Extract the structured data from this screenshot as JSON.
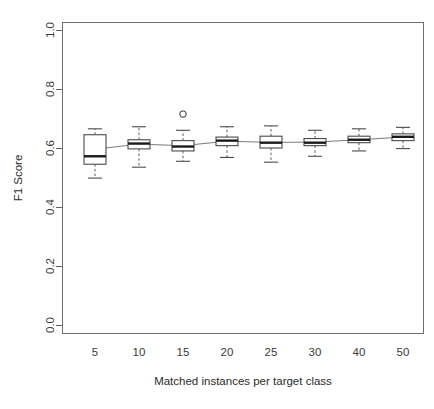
{
  "chart_data": {
    "type": "box",
    "title": "",
    "xlabel": "Matched instances per target class",
    "ylabel": "F1 Score",
    "categories": [
      "5",
      "10",
      "15",
      "20",
      "25",
      "30",
      "40",
      "50"
    ],
    "xtick_labels": [
      "5",
      "10",
      "15",
      "20",
      "25",
      "30",
      "40",
      "50"
    ],
    "ytick_labels": [
      "0.0",
      "0.2",
      "0.4",
      "0.6",
      "0.8",
      "1.0"
    ],
    "ytick_values": [
      0.0,
      0.2,
      0.4,
      0.6,
      0.8,
      1.0
    ],
    "ylim": [
      0.0,
      1.0
    ],
    "grid": false,
    "legend": null,
    "boxes": [
      {
        "category": "5",
        "whisker_low": 0.498,
        "q1": 0.545,
        "median": 0.572,
        "q3": 0.645,
        "whisker_high": 0.665,
        "outliers": []
      },
      {
        "category": "10",
        "whisker_low": 0.535,
        "q1": 0.597,
        "median": 0.615,
        "q3": 0.628,
        "whisker_high": 0.672,
        "outliers": []
      },
      {
        "category": "15",
        "whisker_low": 0.555,
        "q1": 0.59,
        "median": 0.605,
        "q3": 0.625,
        "whisker_high": 0.66,
        "outliers": [
          0.715
        ]
      },
      {
        "category": "20",
        "whisker_low": 0.568,
        "q1": 0.608,
        "median": 0.625,
        "q3": 0.637,
        "whisker_high": 0.672,
        "outliers": []
      },
      {
        "category": "25",
        "whisker_low": 0.552,
        "q1": 0.6,
        "median": 0.618,
        "q3": 0.64,
        "whisker_high": 0.675,
        "outliers": []
      },
      {
        "category": "30",
        "whisker_low": 0.572,
        "q1": 0.608,
        "median": 0.618,
        "q3": 0.632,
        "whisker_high": 0.66,
        "outliers": []
      },
      {
        "category": "40",
        "whisker_low": 0.59,
        "q1": 0.618,
        "median": 0.628,
        "q3": 0.64,
        "whisker_high": 0.665,
        "outliers": []
      },
      {
        "category": "50",
        "whisker_low": 0.598,
        "q1": 0.625,
        "median": 0.638,
        "q3": 0.648,
        "whisker_high": 0.67,
        "outliers": []
      }
    ],
    "mean_line": {
      "name": "mean trend",
      "values": [
        0.596,
        0.613,
        0.608,
        0.623,
        0.619,
        0.62,
        0.628,
        0.637
      ]
    },
    "colors": {
      "box_fill": "#ffffff",
      "box_stroke": "#4a4a4a",
      "median": "#1a1a1a",
      "whisker": "#595959",
      "trend": "#7a7a7a",
      "axis": "#606060",
      "text": "#2b2b2b",
      "background": "#ffffff"
    },
    "geometry": {
      "plot_left": 62,
      "plot_right": 424,
      "plot_top": 22,
      "plot_bottom": 333,
      "y_at_zero": 325,
      "y_at_one": 30,
      "box_width": 22,
      "box_centers": [
        95,
        139,
        183,
        227,
        271,
        315,
        359,
        403
      ]
    }
  }
}
